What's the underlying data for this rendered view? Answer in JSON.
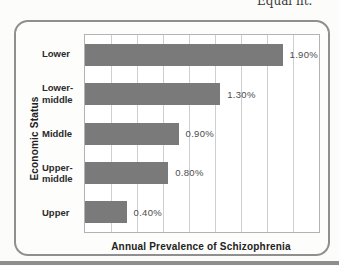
{
  "page": {
    "cropped_header_text": "Equal ht.",
    "background_color": "#fcfcfa",
    "bottom_rule_color": "#8e8e8e"
  },
  "figure": {
    "card_border_color": "#8f8f8f",
    "y_axis_title": "Economic Status",
    "x_axis_title": "Annual Prevalence of Schizophrenia",
    "bar_color": "#7a7a7a",
    "gridline_color": "#cfcfcf",
    "plot_border_color": "#b3b3b3",
    "plot_background": "#ffffff"
  },
  "chart_data": {
    "type": "bar",
    "orientation": "horizontal",
    "title": "",
    "xlabel": "Annual Prevalence of Schizophrenia",
    "ylabel": "Economic Status",
    "categories": [
      "Lower",
      "Lower-middle",
      "Middle",
      "Upper-middle",
      "Upper"
    ],
    "values": [
      1.9,
      1.3,
      0.9,
      0.8,
      0.4
    ],
    "value_labels": [
      "1.90%",
      "1.30%",
      "0.90%",
      "0.80%",
      "0.40%"
    ],
    "xlim": [
      0,
      2.25
    ],
    "grid_step": 0.25,
    "grid": true,
    "legend": false,
    "x_tick_labels_shown": false
  }
}
